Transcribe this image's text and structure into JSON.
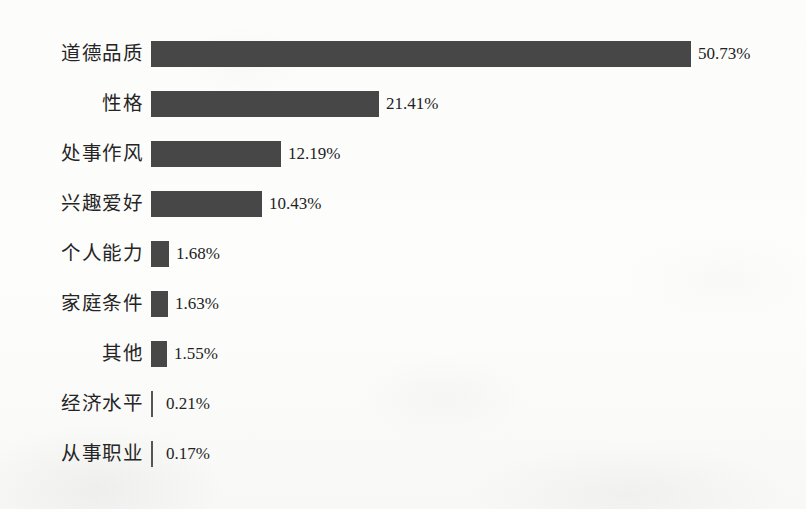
{
  "chart_data": {
    "type": "bar",
    "orientation": "horizontal",
    "title": "",
    "subtitle": "",
    "xlabel": "",
    "ylabel": "",
    "grid": false,
    "legend": null,
    "axis_visible": false,
    "value_suffix": "%",
    "xlim": [
      0,
      50.73
    ],
    "categories": [
      "道德品质",
      "性格",
      "处事作风",
      "兴趣爱好",
      "个人能力",
      "家庭条件",
      "其他",
      "经济水平",
      "从事职业"
    ],
    "values": [
      50.73,
      21.41,
      12.19,
      10.43,
      1.68,
      1.63,
      1.55,
      0.21,
      0.17
    ],
    "value_labels": [
      "50.73%",
      "21.41%",
      "12.19%",
      "10.43%",
      "1.68%",
      "1.63%",
      "1.55%",
      "0.21%",
      "0.17%"
    ],
    "colors": {
      "bar_fill": "#474747",
      "background": "#fdfdfc",
      "label_text": "#252525",
      "value_text": "#232323"
    }
  },
  "rows": [
    {
      "label": "道德品质",
      "value_label": "50.73%"
    },
    {
      "label": "性格",
      "value_label": "21.41%"
    },
    {
      "label": "处事作风",
      "value_label": "12.19%"
    },
    {
      "label": "兴趣爱好",
      "value_label": "10.43%"
    },
    {
      "label": "个人能力",
      "value_label": "1.68%"
    },
    {
      "label": "家庭条件",
      "value_label": "1.63%"
    },
    {
      "label": "其他",
      "value_label": "1.55%"
    },
    {
      "label": "经济水平",
      "value_label": "0.21%"
    },
    {
      "label": "从事职业",
      "value_label": "0.17%"
    }
  ]
}
